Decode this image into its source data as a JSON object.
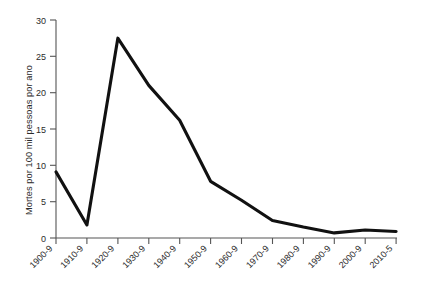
{
  "chart_data": {
    "type": "line",
    "title": "",
    "xlabel": "",
    "ylabel": "Mortes por 100 mil pessoas por ano",
    "categories": [
      "1900-9",
      "1910-9",
      "1920-9",
      "1930-9",
      "1940-9",
      "1950-9",
      "1960-9",
      "1970-9",
      "1980-9",
      "1990-9",
      "2000-9",
      "2010-5"
    ],
    "values": [
      9.1,
      1.8,
      27.5,
      21.0,
      16.2,
      7.8,
      5.2,
      2.4,
      1.5,
      0.7,
      1.1,
      0.9
    ],
    "series": [
      {
        "name": "Mortes por 100 mil pessoas por ano",
        "values": [
          9.1,
          1.8,
          27.5,
          21.0,
          16.2,
          7.8,
          5.2,
          2.4,
          1.5,
          0.7,
          1.1,
          0.9
        ]
      }
    ],
    "yticks": [
      0,
      5,
      10,
      15,
      20,
      25,
      30
    ],
    "ytick_labels": [
      "0",
      "5",
      "10",
      "15",
      "20",
      "25",
      "30"
    ],
    "ylim": [
      0,
      30
    ],
    "grid": false,
    "legend": "none",
    "line_color": "#111111",
    "axis_color": "#555555"
  }
}
